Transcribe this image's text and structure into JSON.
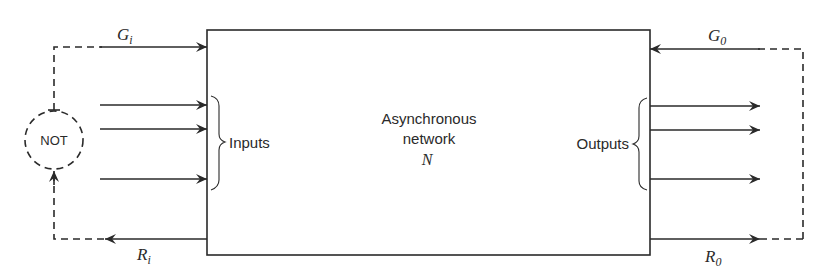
{
  "diagram": {
    "block": {
      "label_line1": "Asynchronous",
      "label_line2": "network",
      "symbol": "N"
    },
    "inputs_label": "Inputs",
    "outputs_label": "Outputs",
    "inverter": {
      "label": "NOT"
    },
    "signals": {
      "grant_in": {
        "base": "G",
        "sub": "i"
      },
      "request_in": {
        "base": "R",
        "sub": "i"
      },
      "grant_out": {
        "base": "G",
        "sub": "0"
      },
      "request_out": {
        "base": "R",
        "sub": "0"
      }
    },
    "input_arrow_count": 3,
    "output_arrow_count": 3,
    "colors": {
      "ink": "#2a2a2a",
      "background": "#ffffff"
    }
  }
}
